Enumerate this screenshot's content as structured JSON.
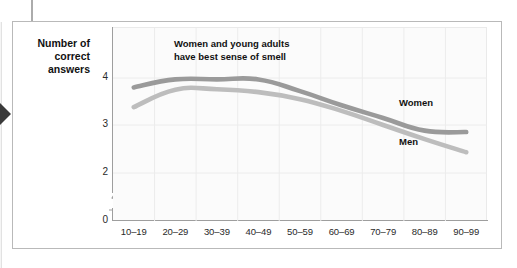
{
  "chart_data": {
    "type": "line",
    "title": "",
    "xlabel": "Age group",
    "ylabel": "Number of correct answers",
    "categories": [
      "10–19",
      "20–29",
      "30–39",
      "40–49",
      "50–59",
      "60–69",
      "70–79",
      "80–89",
      "90–99"
    ],
    "series": [
      {
        "name": "Women",
        "color": "#9a9a9a",
        "values": [
          3.8,
          3.97,
          3.97,
          3.97,
          3.72,
          3.42,
          3.15,
          2.88,
          2.85
        ]
      },
      {
        "name": "Men",
        "color": "#bdbdbd",
        "values": [
          3.38,
          3.75,
          3.76,
          3.7,
          3.55,
          3.3,
          3.0,
          2.7,
          2.42
        ]
      }
    ],
    "ylim": [
      2.0,
      4.25
    ],
    "y_ticks": [
      "4",
      "3",
      "2",
      "0"
    ],
    "y_axis_broken": true,
    "grid": true,
    "legend_position": "inline-right",
    "annotations": [
      {
        "text_line_1": "Women and young adults",
        "text_line_2": "have best sense of smell"
      }
    ]
  },
  "axis": {
    "y_title_line_1": "Number of",
    "y_title_line_2": "correct answers",
    "x_title": "Age group"
  },
  "labels": {
    "women": "Women",
    "men": "Men"
  }
}
